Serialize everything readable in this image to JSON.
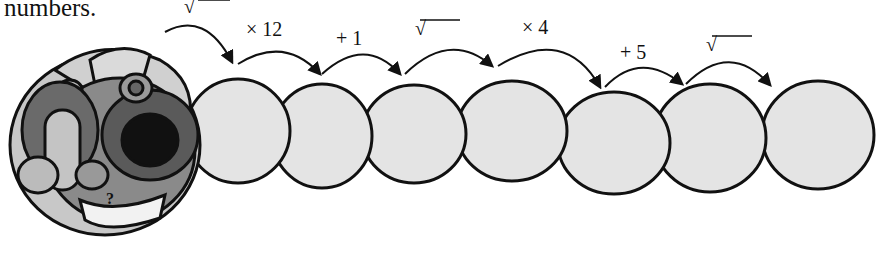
{
  "caption": "numbers.",
  "caterpillar": {
    "head_label": "?",
    "segment_count": 8,
    "operations": [
      {
        "label": "√",
        "type": "square-root"
      },
      {
        "label": "× 12",
        "type": "multiply"
      },
      {
        "label": "+ 1",
        "type": "add"
      },
      {
        "label": "√",
        "type": "square-root"
      },
      {
        "label": "× 4",
        "type": "multiply"
      },
      {
        "label": "+ 5",
        "type": "add"
      },
      {
        "label": "√",
        "type": "square-root"
      }
    ]
  },
  "colors": {
    "segment_fill": "#e4e4e4",
    "outline": "#111111",
    "head_light": "#c8c8c8",
    "head_mid": "#8a8a8a",
    "head_dark": "#5a5a5a"
  }
}
